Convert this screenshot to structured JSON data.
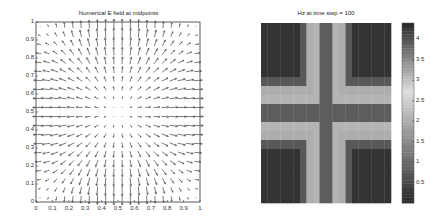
{
  "chart_data": [
    {
      "type": "quiver",
      "title": "Numerical E field at midpoints",
      "xlabel": "",
      "ylabel": "",
      "xlim": [
        0,
        1
      ],
      "ylim": [
        0,
        1
      ],
      "xticks": [
        "0",
        "0.1",
        "0.2",
        "0.3",
        "0.4",
        "0.5",
        "0.6",
        "0.7",
        "0.8",
        "0.9",
        "1"
      ],
      "yticks": [
        "0",
        "0.1",
        "0.2",
        "0.3",
        "0.4",
        "0.5",
        "0.6",
        "0.7",
        "0.8",
        "0.9",
        "1"
      ],
      "grid": false,
      "grid_points": 20,
      "field_description": "Ex ~ cos(pi x) sin(pi y), Ey ~ sin(pi x) cos(pi y); strong horizontal arrows at left/right edges near y=0.5, strong vertical arrows at top/bottom edges near x=0.5, near-zero at center"
    },
    {
      "type": "heatmap",
      "title": "Hz at time step = 100",
      "colormap": "gray, dark at both ends, lightest near 2.5-3",
      "clim": [
        0,
        4.4
      ],
      "colorbar_ticks": [
        "4",
        "3.5",
        "3",
        "2.5",
        "2",
        "1.5",
        "1",
        "0.5"
      ],
      "grid_size": [
        20,
        20
      ],
      "pattern": "symmetric dark cross through the center, dark corners, light band between"
    }
  ],
  "left": {
    "title": "Numerical E field at midpoints",
    "xticks": [
      "0",
      "0.1",
      "0.2",
      "0.3",
      "0.4",
      "0.5",
      "0.6",
      "0.7",
      "0.8",
      "0.9",
      "1"
    ],
    "yticks": [
      "0",
      "0.1",
      "0.2",
      "0.3",
      "0.4",
      "0.5",
      "0.6",
      "0.7",
      "0.8",
      "0.9",
      "1"
    ]
  },
  "right": {
    "title": "Hz at time step = 100",
    "cbar_ticks": [
      "4",
      "3.5",
      "3",
      "2.5",
      "2",
      "1.5",
      "1",
      "0.5"
    ],
    "cbar_values": [
      4,
      3.5,
      3,
      2.5,
      2,
      1.5,
      1,
      0.5
    ]
  }
}
